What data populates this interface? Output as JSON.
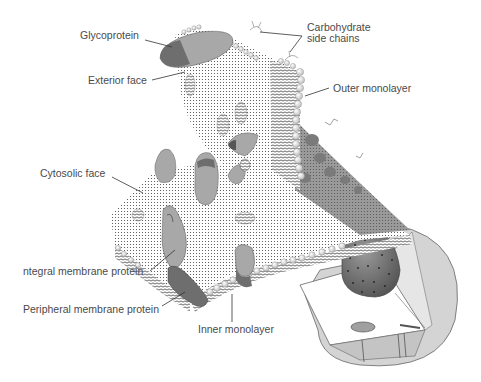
{
  "diagram": {
    "labels": {
      "glycoprotein": "Glycoprotein",
      "carbohydrate_line1": "Carbohydrate",
      "carbohydrate_line2": "side chains",
      "exterior_face": "Exterior face",
      "outer_monolayer": "Outer monolayer",
      "cytosolic_face": "Cytosolic face",
      "integral_protein": "ntegral membrane protein",
      "peripheral_protein": "Peripheral membrane protein",
      "inner_monolayer": "Inner monolayer"
    },
    "colors": {
      "protein_light": "#a8a8a8",
      "protein_dark": "#6e6e6e",
      "nucleus": "#7a7a7a",
      "cell_body": "#d0d0d0",
      "line": "#333333"
    }
  }
}
